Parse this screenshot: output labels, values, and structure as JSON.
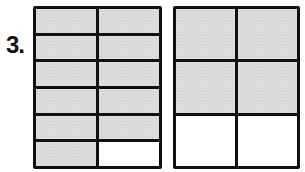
{
  "problem": {
    "number_label": "3.",
    "figures": [
      {
        "id": "left",
        "rows": 6,
        "cols": 2,
        "total_parts": 12,
        "shaded_parts": 11,
        "fraction": "11/12",
        "cells": [
          true,
          true,
          true,
          true,
          true,
          true,
          true,
          true,
          true,
          true,
          true,
          false
        ]
      },
      {
        "id": "right",
        "rows": 3,
        "cols": 2,
        "total_parts": 6,
        "shaded_parts": 4,
        "fraction": "4/6",
        "cells": [
          true,
          true,
          true,
          true,
          false,
          false
        ]
      }
    ]
  },
  "colors": {
    "shaded": "#d8d8d8",
    "unshaded": "#ffffff",
    "line": "#111111"
  }
}
